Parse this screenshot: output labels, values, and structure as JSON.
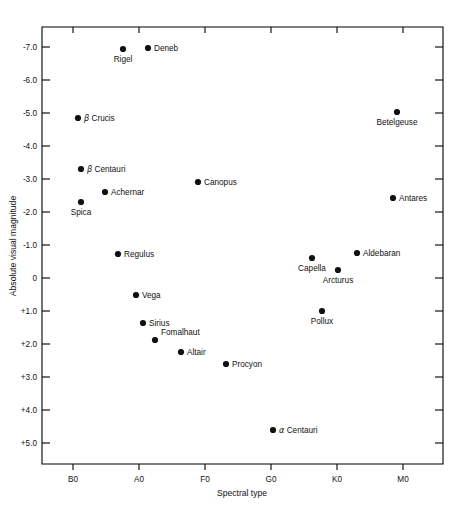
{
  "chart_data": {
    "type": "scatter",
    "title": "",
    "xlabel": "Spectral type",
    "ylabel": "Absolute visual magnitude",
    "x_ticks": [
      "B0",
      "A0",
      "F0",
      "G0",
      "K0",
      "M0"
    ],
    "x_tick_px": [
      73,
      139,
      205,
      271,
      337,
      403
    ],
    "y_ticks": [
      "-7.0",
      "-6.0",
      "-5.0",
      "-4.0",
      "-3.0",
      "-2.0",
      "-1.0",
      "0",
      "+1.0",
      "+2.0",
      "+3.0",
      "+4.0",
      "+5.0"
    ],
    "y_tick_values": [
      -7.0,
      -6.0,
      -5.0,
      -4.0,
      -3.0,
      -2.0,
      -1.0,
      0,
      1.0,
      2.0,
      3.0,
      4.0,
      5.0
    ],
    "y_axis_inverted": true,
    "ylim": [
      -7.6,
      5.6
    ],
    "grid": false,
    "legend": "none",
    "plot_area_px": {
      "left": 42,
      "right": 443,
      "top": 27,
      "bottom": 464
    },
    "points": [
      {
        "name": "Rigel",
        "spectral_type": "B8",
        "magnitude": -7.0,
        "px": 123,
        "py": 49,
        "label_pos": "below"
      },
      {
        "name": "Deneb",
        "spectral_type": "A2",
        "magnitude": -7.0,
        "px": 148,
        "py": 48,
        "label_pos": "right"
      },
      {
        "name": "β Crucis",
        "spectral_type": "B0",
        "magnitude": -5.0,
        "px": 78,
        "py": 118,
        "label_pos": "right",
        "greek": true
      },
      {
        "name": "Betelgeuse",
        "spectral_type": "M2",
        "magnitude": -5.0,
        "px": 397,
        "py": 112,
        "label_pos": "below"
      },
      {
        "name": "β Centauri",
        "spectral_type": "B1",
        "magnitude": -3.5,
        "px": 81,
        "py": 169,
        "label_pos": "right",
        "greek": true
      },
      {
        "name": "Canopus",
        "spectral_type": "F0",
        "magnitude": -3.0,
        "px": 198,
        "py": 182,
        "label_pos": "right"
      },
      {
        "name": "Achernar",
        "spectral_type": "B5",
        "magnitude": -2.7,
        "px": 105,
        "py": 192,
        "label_pos": "right"
      },
      {
        "name": "Spica",
        "spectral_type": "B1",
        "magnitude": -2.4,
        "px": 81,
        "py": 202,
        "label_pos": "below"
      },
      {
        "name": "Antares",
        "spectral_type": "M1",
        "magnitude": -2.4,
        "px": 393,
        "py": 198,
        "label_pos": "right"
      },
      {
        "name": "Regulus",
        "spectral_type": "B7",
        "magnitude": -0.7,
        "px": 118,
        "py": 254,
        "label_pos": "right"
      },
      {
        "name": "Aldebaran",
        "spectral_type": "K5",
        "magnitude": -0.2,
        "px": 357,
        "py": 253,
        "label_pos": "right"
      },
      {
        "name": "Capella",
        "spectral_type": "G8",
        "magnitude": 0.0,
        "px": 312,
        "py": 258,
        "label_pos": "below"
      },
      {
        "name": "Arcturus",
        "spectral_type": "K2",
        "magnitude": 0.2,
        "px": 338,
        "py": 270,
        "label_pos": "below"
      },
      {
        "name": "Vega",
        "spectral_type": "A0",
        "magnitude": 0.5,
        "px": 136,
        "py": 295,
        "label_pos": "right"
      },
      {
        "name": "Pollux",
        "spectral_type": "K0",
        "magnitude": 1.0,
        "px": 322,
        "py": 311,
        "label_pos": "below"
      },
      {
        "name": "Sirius",
        "spectral_type": "A1",
        "magnitude": 1.4,
        "px": 143,
        "py": 323,
        "label_pos": "right"
      },
      {
        "name": "Fomalhaut",
        "spectral_type": "A3",
        "magnitude": 2.0,
        "px": 155,
        "py": 340,
        "label_pos": "above-right"
      },
      {
        "name": "Altair",
        "spectral_type": "A7",
        "magnitude": 2.3,
        "px": 181,
        "py": 352,
        "label_pos": "right"
      },
      {
        "name": "Procyon",
        "spectral_type": "F5",
        "magnitude": 2.7,
        "px": 226,
        "py": 364,
        "label_pos": "right"
      },
      {
        "name": "α Centauri",
        "spectral_type": "G2",
        "magnitude": 4.7,
        "px": 273,
        "py": 430,
        "label_pos": "right",
        "greek": true
      }
    ]
  },
  "figure": {
    "xlabel": "Spectral type",
    "ylabel": "Absolute visual magnitude"
  }
}
